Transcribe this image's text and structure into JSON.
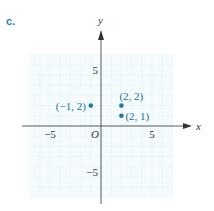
{
  "part_label": "c.",
  "chart_data": {
    "type": "scatter",
    "title": "",
    "xlabel": "x",
    "ylabel": "y",
    "origin_label": "O",
    "xlim": [
      -7,
      7
    ],
    "ylim": [
      -7,
      7
    ],
    "grid": true,
    "x_ticks": [
      {
        "value": -5,
        "label": "−5"
      },
      {
        "value": 5,
        "label": "5"
      }
    ],
    "y_ticks": [
      {
        "value": 5,
        "label": "5"
      },
      {
        "value": -5,
        "label": "−5"
      }
    ],
    "points": [
      {
        "x": -1,
        "y": 2,
        "label": "(−1, 2)",
        "label_pos": "left"
      },
      {
        "x": 2,
        "y": 2,
        "label": "(2, 2)",
        "label_pos": "above"
      },
      {
        "x": 2,
        "y": 1,
        "label": "(2, 1)",
        "label_pos": "right"
      }
    ],
    "colors": {
      "point": "#1a7ca3",
      "grid": "#e3f3f6",
      "axis": "#333333"
    }
  }
}
